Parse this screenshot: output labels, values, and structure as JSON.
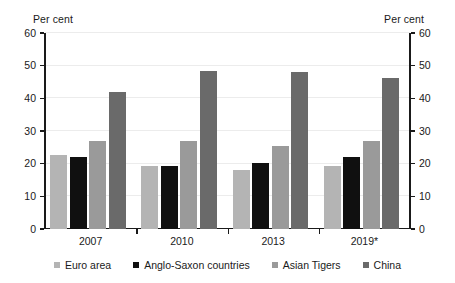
{
  "chart_data": {
    "type": "bar",
    "title": "",
    "subtitle": "",
    "xlabel": "",
    "ylabel": "Per cent",
    "ylabel_right": "Per cent",
    "ylim": [
      0,
      60
    ],
    "yticks": [
      0,
      10,
      20,
      30,
      40,
      50,
      60
    ],
    "ytick_labels": [
      "0",
      "10",
      "20",
      "30",
      "40",
      "50",
      "60"
    ],
    "grid": true,
    "grid_axis": "y",
    "legend_position": "bottom",
    "dual_axis": true,
    "categories": [
      "2007",
      "2010",
      "2013",
      "2019*"
    ],
    "series": [
      {
        "name": "Euro area",
        "color": "#b4b4b4",
        "values": [
          22.6,
          19.3,
          18.0,
          19.3
        ]
      },
      {
        "name": "Anglo-Saxon countries",
        "color": "#101010",
        "values": [
          22.1,
          19.2,
          20.2,
          22.0
        ]
      },
      {
        "name": "Asian Tigers",
        "color": "#9a9a9a",
        "values": [
          27.0,
          26.9,
          25.5,
          26.8
        ]
      },
      {
        "name": "China",
        "color": "#6a6a6a",
        "values": [
          41.8,
          48.3,
          48.1,
          46.1
        ]
      }
    ],
    "annotations": [
      "* denotes projected / estimated figures"
    ]
  },
  "axis": {
    "left_title": "Per cent",
    "right_title": "Per cent"
  },
  "legend": {
    "items": [
      {
        "label": "Euro area"
      },
      {
        "label": "Anglo-Saxon countries"
      },
      {
        "label": "Asian Tigers"
      },
      {
        "label": "China"
      }
    ]
  }
}
